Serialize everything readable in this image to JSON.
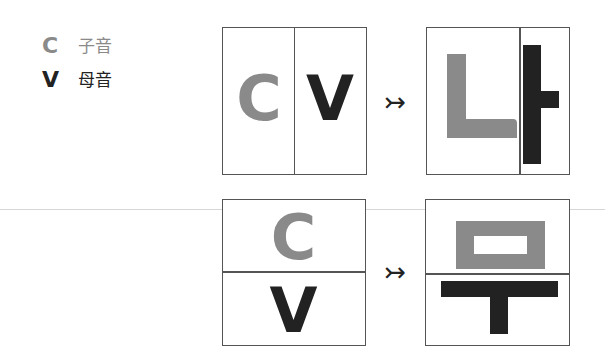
{
  "colors": {
    "consonant": "#8a8a8a",
    "vowel": "#222222",
    "border": "#555555",
    "label_consonant": "#8a8a8a",
    "label_vowel": "#222222"
  },
  "legend": {
    "items": [
      {
        "key": "C",
        "label": "子音",
        "role": "consonant"
      },
      {
        "key": "V",
        "label": "母音",
        "role": "vowel"
      }
    ]
  },
  "diagrams": [
    {
      "layout": "horizontal",
      "input": {
        "first": "C",
        "second": "V"
      },
      "arrow": "↣",
      "output": {
        "syllable": "나",
        "consonant_jamo": "ㄴ",
        "vowel_jamo": "ㅏ"
      }
    },
    {
      "layout": "vertical",
      "input": {
        "first": "C",
        "second": "V"
      },
      "arrow": "↣",
      "output": {
        "syllable": "무",
        "consonant_jamo": "ㅁ",
        "vowel_jamo": "ㅜ"
      }
    }
  ]
}
